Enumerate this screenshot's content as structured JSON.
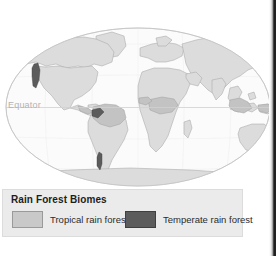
{
  "figure": {
    "equator_label": "Equator",
    "map_type": "world-map-elliptical-projection"
  },
  "legend": {
    "title": "Rain Forest Biomes",
    "entries": [
      {
        "label": "Tropical rain forest",
        "color": "#c9c9c9",
        "swatch_name": "tropical-rain-forest-swatch"
      },
      {
        "label": "Temperate rain forest",
        "color": "#5c5c5c",
        "swatch_name": "temperate-rain-forest-swatch"
      }
    ]
  },
  "colors": {
    "ocean": "#fbfbfb",
    "land": "#dcdcdc",
    "land_outline": "#a8a8a8",
    "tropical": "#c9c9c9",
    "temperate": "#5c5c5c",
    "graticule": "#e4e4e4",
    "equator_line": "#cfcfcf",
    "legend_background": "#ebebeb",
    "legend_title_text": "#1d1d1d",
    "equator_text": "#b3b3b3",
    "scan_edge": "#141414"
  }
}
